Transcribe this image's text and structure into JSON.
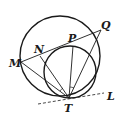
{
  "diagram": {
    "type": "geometry",
    "circles": [
      {
        "name": "large-circle",
        "cx": 60,
        "cy": 56,
        "r": 40
      },
      {
        "name": "small-circle",
        "cx": 70,
        "cy": 72,
        "r": 26
      }
    ],
    "points": {
      "M": {
        "label": "M",
        "x": 21,
        "y": 62
      },
      "N": {
        "label": "N",
        "x": 40,
        "y": 56
      },
      "P": {
        "label": "P",
        "x": 73,
        "y": 46
      },
      "Q": {
        "label": "Q",
        "x": 101,
        "y": 30
      },
      "T": {
        "label": "T",
        "x": 69,
        "y": 98
      },
      "L": {
        "label": "L",
        "x": 104,
        "y": 93
      }
    },
    "segments": [
      "MQ",
      "MT",
      "NT",
      "PT",
      "QT"
    ],
    "tangent_line": {
      "label": "L",
      "style": "dashed",
      "from": [
        38,
        105
      ],
      "to": [
        104,
        93
      ]
    },
    "angle_marks": [
      "angle-NTM",
      "angle-PTQ"
    ],
    "labels": {
      "M": "M",
      "N": "N",
      "P": "P",
      "Q": "Q",
      "T": "T",
      "L": "L"
    }
  }
}
